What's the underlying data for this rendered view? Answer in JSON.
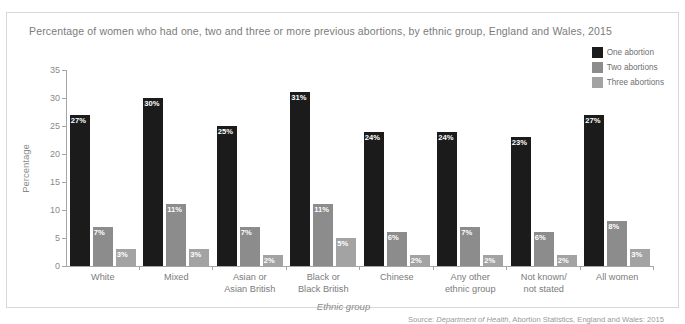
{
  "figure": {
    "title": "Percentage of women who had one, two and three or more previous abortions, by ethnic group, England and Wales, 2015",
    "source_prefix": "Source: ",
    "source_italic": "Department of Health",
    "source_rest": ", Abortion Statistics, England and Wales: 2015"
  },
  "colors": {
    "series_one": "#1b1b1b",
    "series_two": "#8c8c8c",
    "series_three": "#a3a3a3",
    "axis": "#a6a6a6",
    "text": "#7b7b7b",
    "border": "#d8d8d8"
  },
  "chart_data": {
    "type": "bar",
    "title": "Percentage of women who had one, two and three or more previous abortions, by ethnic group, England and Wales, 2015",
    "xlabel": "Ethnic group",
    "ylabel": "Percentage",
    "ylim": [
      0,
      35
    ],
    "yticks": [
      0,
      5,
      10,
      15,
      20,
      25,
      30,
      35
    ],
    "ytick_labels": [
      "0",
      "5",
      "10",
      "15",
      "20",
      "25",
      "30",
      "35"
    ],
    "grid": false,
    "legend_position": "top-right",
    "categories": [
      "White",
      "Mixed",
      "Asian or Asian British",
      "Black or Black British",
      "Chinese",
      "Any other ethnic group",
      "Not known/ not stated",
      "All women"
    ],
    "category_lines": [
      [
        "White"
      ],
      [
        "Mixed"
      ],
      [
        "Asian or",
        "Asian British"
      ],
      [
        "Black or",
        "Black British"
      ],
      [
        "Chinese"
      ],
      [
        "Any other",
        "ethnic group"
      ],
      [
        "Not known/",
        "not stated"
      ],
      [
        "All women"
      ]
    ],
    "series": [
      {
        "name": "One abortion",
        "color": "#1b1b1b",
        "values": [
          27,
          30,
          25,
          31,
          24,
          24,
          23,
          27
        ],
        "labels": [
          "27%",
          "30%",
          "25%",
          "31%",
          "24%",
          "24%",
          "23%",
          "27%"
        ]
      },
      {
        "name": "Two abortions",
        "color": "#8c8c8c",
        "values": [
          7,
          11,
          7,
          11,
          6,
          7,
          6,
          8
        ],
        "labels": [
          "7%",
          "11%",
          "7%",
          "11%",
          "6%",
          "7%",
          "6%",
          "8%"
        ]
      },
      {
        "name": "Three abortions",
        "color": "#a3a3a3",
        "values": [
          3,
          3,
          2,
          5,
          2,
          2,
          2,
          3
        ],
        "labels": [
          "3%",
          "3%",
          "2%",
          "5%",
          "2%",
          "2%",
          "2%",
          "3%"
        ]
      }
    ]
  }
}
